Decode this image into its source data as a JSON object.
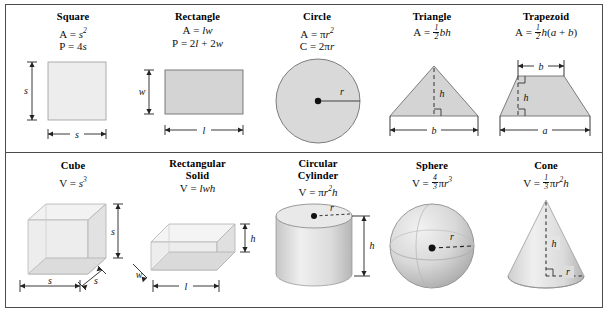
{
  "document": {
    "type": "geometry-formula-reference-chart",
    "background_color": "#ffffff",
    "border_color": "#4b4b4b",
    "shape_fill_light": "#ededed",
    "shape_fill_mid": "#d4d4d4",
    "shape_fill_dark": "#b9b9b9"
  },
  "plane_figures": [
    {
      "id": "square",
      "title": "Square",
      "formulas": [
        "A = s2",
        "P = 4s"
      ],
      "labels": {
        "height": "s",
        "width": "s"
      }
    },
    {
      "id": "rectangle",
      "title": "Rectangle",
      "formulas": [
        "A = lw",
        "P = 2l + 2w"
      ],
      "labels": {
        "height": "w",
        "width": "l"
      }
    },
    {
      "id": "circle",
      "title": "Circle",
      "formulas": [
        "A = pi r2",
        "C = 2 pi r"
      ],
      "labels": {
        "radius": "r"
      }
    },
    {
      "id": "triangle",
      "title": "Triangle",
      "formulas": [
        "A = 1/2 bh"
      ],
      "labels": {
        "height": "h",
        "base": "b"
      }
    },
    {
      "id": "trapezoid",
      "title": "Trapezoid",
      "formulas": [
        "A = 1/2 h(a + b)"
      ],
      "labels": {
        "top": "b",
        "height": "h",
        "base": "a"
      }
    }
  ],
  "solids": [
    {
      "id": "cube",
      "title": "Cube",
      "formulas": [
        "V = s3"
      ],
      "labels": {
        "height": "s",
        "width": "s",
        "depth": "s"
      }
    },
    {
      "id": "rectangular-solid",
      "title_line1": "Rectangular",
      "title_line2": "Solid",
      "formulas": [
        "V = lwh"
      ],
      "labels": {
        "height": "h",
        "depth": "w",
        "length": "l"
      }
    },
    {
      "id": "circular-cylinder",
      "title_line1": "Circular",
      "title_line2": "Cylinder",
      "formulas": [
        "V = pi r2 h"
      ],
      "labels": {
        "radius": "r",
        "height": "h"
      }
    },
    {
      "id": "sphere",
      "title": "Sphere",
      "formulas": [
        "V = 4/3 pi r3"
      ],
      "labels": {
        "radius": "r"
      }
    },
    {
      "id": "cone",
      "title": "Cone",
      "formulas": [
        "V = 1/3 pi r2 h"
      ],
      "labels": {
        "height": "h",
        "radius": "r"
      }
    }
  ],
  "symbols": {
    "A": "A",
    "P": "P",
    "C": "C",
    "V": "V",
    "s": "s",
    "l": "l",
    "w": "w",
    "r": "r",
    "h": "h",
    "b": "b",
    "a": "a",
    "pi": "π",
    "equals": "=",
    "plus": "+",
    "two": "2",
    "three": "3",
    "four": "4"
  }
}
